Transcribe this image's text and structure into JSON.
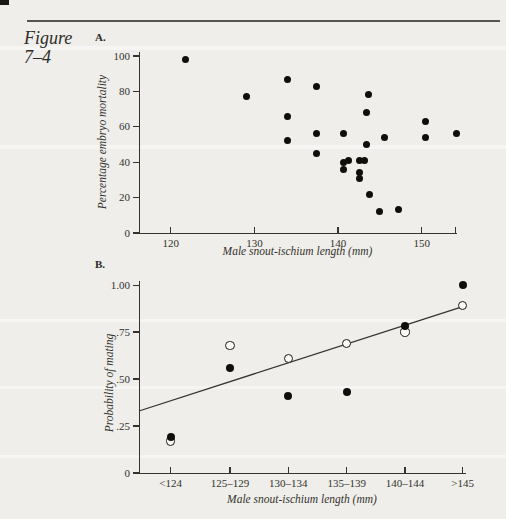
{
  "page": {
    "figure_label_line1": "Figure",
    "figure_label_line2": "7–4",
    "background": "#efeeea",
    "ink": "#2b2a27"
  },
  "chart_data": [
    {
      "id": "A",
      "panel_label": "A.",
      "type": "scatter",
      "xlabel": "Male snout-ischium length (mm)",
      "ylabel": "Percentage embryo mortality",
      "xlim": [
        116.2,
        154.1
      ],
      "ylim": [
        0,
        102.3
      ],
      "x_ticks": [
        120,
        130,
        140,
        150
      ],
      "axis_end_tick": true,
      "y_ticks": [
        0,
        20,
        40,
        60,
        80,
        100
      ],
      "marker": "filled-circle",
      "points": [
        [
          121.8,
          98
        ],
        [
          129.0,
          77
        ],
        [
          134.0,
          87
        ],
        [
          134.0,
          66
        ],
        [
          134.0,
          52
        ],
        [
          137.4,
          83
        ],
        [
          137.4,
          56
        ],
        [
          137.4,
          45
        ],
        [
          140.6,
          56
        ],
        [
          140.6,
          40
        ],
        [
          141.2,
          41
        ],
        [
          140.7,
          36
        ],
        [
          142.6,
          41
        ],
        [
          143.2,
          41
        ],
        [
          142.6,
          34
        ],
        [
          142.6,
          31
        ],
        [
          143.6,
          78
        ],
        [
          143.4,
          68
        ],
        [
          143.4,
          50
        ],
        [
          143.7,
          22
        ],
        [
          144.9,
          12
        ],
        [
          145.5,
          54
        ],
        [
          147.2,
          13
        ],
        [
          150.4,
          63
        ],
        [
          150.4,
          54
        ],
        [
          154.2,
          56
        ]
      ]
    },
    {
      "id": "B",
      "panel_label": "B.",
      "type": "scatter",
      "xlabel": "Male snout-ischium length (mm)",
      "ylabel": "Probability of mating",
      "ylim": [
        0,
        1.022
      ],
      "y_ticks": [
        {
          "v": 0,
          "label": "0"
        },
        {
          "v": 0.25,
          "label": ".25"
        },
        {
          "v": 0.5,
          "label": ".50"
        },
        {
          "v": 0.75,
          "label": ".75"
        },
        {
          "v": 1.0,
          "label": "1.00"
        }
      ],
      "categories": [
        "<124",
        "125–129",
        "130–134",
        "135–139",
        "140–144",
        ">145"
      ],
      "category_fracs": [
        0.097,
        0.279,
        0.458,
        0.637,
        0.816,
        0.993
      ],
      "series": [
        {
          "name": "open",
          "marker": "open-circle",
          "values": [
            0.17,
            0.68,
            0.61,
            0.69,
            0.75,
            0.89
          ]
        },
        {
          "name": "filled",
          "marker": "filled-circle",
          "values": [
            0.19,
            0.56,
            0.41,
            0.43,
            0.78,
            1.0
          ]
        }
      ],
      "regression_line": {
        "x1_frac": 0,
        "y1": 0.33,
        "x2_frac": 1.0,
        "y2": 0.89
      }
    }
  ]
}
